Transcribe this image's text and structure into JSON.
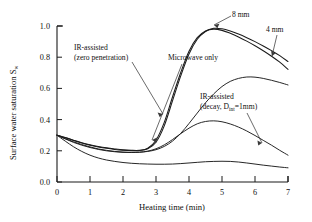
{
  "chart_data": {
    "type": "line",
    "title": "",
    "xlabel": "Heating time (min)",
    "ylabel": "Surface water saturation S",
    "ylabel_sub": "w",
    "xlim": [
      0,
      7
    ],
    "ylim": [
      0.0,
      1.0
    ],
    "xticks": [
      "0",
      "1",
      "2",
      "3",
      "4",
      "5",
      "6",
      "7"
    ],
    "yticks": [
      "0.0",
      "0.2",
      "0.4",
      "0.6",
      "0.8",
      "1.0"
    ],
    "grid": false,
    "legend_position": "inline-annotations",
    "x": [
      0,
      0.25,
      0.5,
      0.75,
      1,
      1.25,
      1.5,
      1.75,
      2,
      2.25,
      2.5,
      2.75,
      3,
      3.25,
      3.5,
      3.75,
      4,
      4.25,
      4.5,
      4.75,
      5,
      5.25,
      5.5,
      5.75,
      6,
      6.25,
      6.5,
      6.75,
      7
    ],
    "series": [
      {
        "name": "8 mm",
        "label": "8 mm",
        "description": "IR-assisted (zero penetration), 8 mm",
        "values": [
          0.3,
          0.285,
          0.268,
          0.252,
          0.239,
          0.228,
          0.219,
          0.212,
          0.206,
          0.203,
          0.203,
          0.213,
          0.255,
          0.36,
          0.52,
          0.68,
          0.82,
          0.915,
          0.965,
          0.985,
          0.982,
          0.968,
          0.948,
          0.925,
          0.9,
          0.872,
          0.842,
          0.81,
          0.772
        ]
      },
      {
        "name": "4 mm",
        "label": "4 mm",
        "description": "IR-assisted (zero penetration), 4 mm",
        "values": [
          0.3,
          0.284,
          0.266,
          0.25,
          0.236,
          0.225,
          0.216,
          0.209,
          0.204,
          0.201,
          0.202,
          0.216,
          0.268,
          0.382,
          0.545,
          0.702,
          0.838,
          0.925,
          0.968,
          0.98,
          0.972,
          0.953,
          0.93,
          0.903,
          0.873,
          0.841,
          0.806,
          0.768,
          0.722
        ]
      },
      {
        "name": "Microwave only",
        "label": "Microwave only",
        "description": "Microwave only",
        "values": [
          0.3,
          0.278,
          0.258,
          0.24,
          0.225,
          0.212,
          0.203,
          0.196,
          0.192,
          0.19,
          0.191,
          0.196,
          0.207,
          0.228,
          0.262,
          0.312,
          0.375,
          0.442,
          0.508,
          0.565,
          0.612,
          0.645,
          0.664,
          0.673,
          0.672,
          0.664,
          0.652,
          0.638,
          0.622
        ]
      },
      {
        "name": "IR-assisted decay",
        "label": "IR-assisted (decay, D_inf=1mm)",
        "description": "IR-assisted with decay, D_int = 1 mm",
        "values": [
          0.3,
          0.276,
          0.254,
          0.236,
          0.221,
          0.209,
          0.2,
          0.194,
          0.19,
          0.189,
          0.191,
          0.198,
          0.213,
          0.238,
          0.272,
          0.31,
          0.345,
          0.373,
          0.388,
          0.392,
          0.386,
          0.372,
          0.352,
          0.327,
          0.298,
          0.267,
          0.236,
          0.203,
          0.172
        ]
      },
      {
        "name": "lower curve",
        "label": "",
        "description": "lowest saturation curve",
        "values": [
          0.3,
          0.262,
          0.226,
          0.196,
          0.172,
          0.154,
          0.141,
          0.132,
          0.125,
          0.12,
          0.117,
          0.115,
          0.114,
          0.114,
          0.115,
          0.118,
          0.122,
          0.126,
          0.13,
          0.132,
          0.133,
          0.132,
          0.128,
          0.122,
          0.115,
          0.108,
          0.102,
          0.096,
          0.091
        ]
      }
    ],
    "annotations": [
      {
        "id": "ir-zero",
        "line1": "IR-assisted",
        "line2": "(zero penetration)"
      },
      {
        "id": "microwave",
        "text": "Microwave only"
      },
      {
        "id": "ir-decay",
        "line1": "IR-assisted",
        "line2_pre": "(decay, D",
        "line2_sub": "int",
        "line2_post": "=1mm)"
      },
      {
        "id": "eight-mm",
        "text": "8 mm"
      },
      {
        "id": "four-mm",
        "text": "4 mm"
      }
    ]
  }
}
